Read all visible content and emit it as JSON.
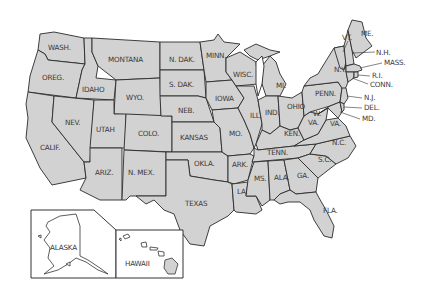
{
  "map": {
    "title": "",
    "fill_color": "#d2d2d2",
    "border_color": "#2a2a2a",
    "background": "#ffffff",
    "states": [
      {
        "id": "wa",
        "label": "WASH."
      },
      {
        "id": "or",
        "label": "OREG."
      },
      {
        "id": "ca",
        "label": "CALIF."
      },
      {
        "id": "nv",
        "label": "NEV."
      },
      {
        "id": "id",
        "label": "IDAHO"
      },
      {
        "id": "mt",
        "label": "MONTANA"
      },
      {
        "id": "wy",
        "label": "WYO."
      },
      {
        "id": "ut",
        "label": "UTAH"
      },
      {
        "id": "az",
        "label": "ARIZ."
      },
      {
        "id": "co",
        "label": "COLO."
      },
      {
        "id": "nm",
        "label": "N. MEX."
      },
      {
        "id": "nd",
        "label": "N. DAK."
      },
      {
        "id": "sd",
        "label": "S. DAK."
      },
      {
        "id": "ne",
        "label": "NEB."
      },
      {
        "id": "ks",
        "label": "KANSAS"
      },
      {
        "id": "ok",
        "label": "OKLA."
      },
      {
        "id": "tx",
        "label": "TEXAS"
      },
      {
        "id": "mn",
        "label": "MINN."
      },
      {
        "id": "ia",
        "label": "IOWA"
      },
      {
        "id": "mo",
        "label": "MO."
      },
      {
        "id": "ar",
        "label": "ARK."
      },
      {
        "id": "la",
        "label": "LA."
      },
      {
        "id": "wi",
        "label": "WISC."
      },
      {
        "id": "il",
        "label": "ILL."
      },
      {
        "id": "mi",
        "label": "MI."
      },
      {
        "id": "in",
        "label": "IND."
      },
      {
        "id": "oh",
        "label": "OHIO"
      },
      {
        "id": "ky",
        "label": "KEN."
      },
      {
        "id": "tn",
        "label": "TENN."
      },
      {
        "id": "ms",
        "label": "MS."
      },
      {
        "id": "al",
        "label": "ALA."
      },
      {
        "id": "ga",
        "label": "GA."
      },
      {
        "id": "fl",
        "label": "FLA."
      },
      {
        "id": "sc",
        "label": "S.C."
      },
      {
        "id": "nc",
        "label": "N.C."
      },
      {
        "id": "va",
        "label": "VA."
      },
      {
        "id": "wv_w",
        "label": "W."
      },
      {
        "id": "wv_va",
        "label": "VA."
      },
      {
        "id": "pa",
        "label": "PENN."
      },
      {
        "id": "ny",
        "label": "N.Y."
      },
      {
        "id": "vt",
        "label": "VT."
      },
      {
        "id": "me",
        "label": "ME."
      },
      {
        "id": "nh",
        "label": "N.H."
      },
      {
        "id": "ma",
        "label": "MASS."
      },
      {
        "id": "ri",
        "label": "R.I."
      },
      {
        "id": "ct",
        "label": "CONN."
      },
      {
        "id": "nj",
        "label": "N.J."
      },
      {
        "id": "de",
        "label": "DEL."
      },
      {
        "id": "md",
        "label": "MD."
      }
    ],
    "insets": {
      "alaska": {
        "label": "ALASKA"
      },
      "hawaii": {
        "label": "HAWAII"
      }
    }
  }
}
